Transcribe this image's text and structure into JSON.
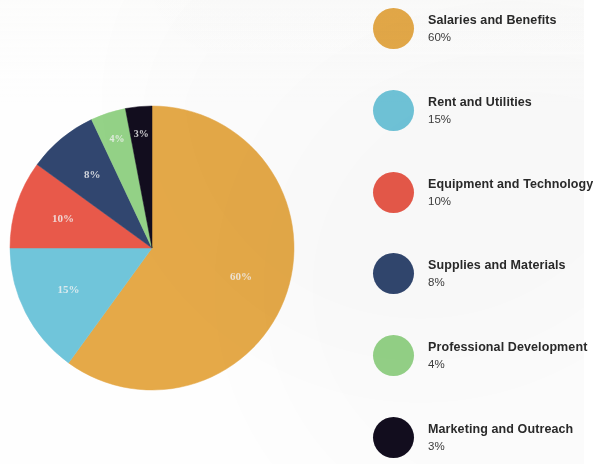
{
  "chart_data": {
    "type": "pie",
    "title": "",
    "subtitle": "",
    "xlabel": "",
    "ylabel": "",
    "legend_position": "right",
    "grid": false,
    "start_angle_deg": 0,
    "direction": "clockwise",
    "total": 100,
    "unit": "%",
    "categories": [
      "Salaries and Benefits",
      "Rent and Utilities",
      "Equipment and Technology",
      "Supplies and Materials",
      "Professional Development",
      "Marketing and Outreach"
    ],
    "values": [
      60,
      15,
      10,
      8,
      4,
      3
    ],
    "slice_labels": [
      "60%",
      "15%",
      "10%",
      "8%",
      "4%",
      "3%"
    ],
    "colors": [
      "#e5a948",
      "#70c5da",
      "#e8594a",
      "#31466f",
      "#94d287",
      "#120d1e"
    ],
    "slices": [
      {
        "label": "Salaries and Benefits",
        "value": 60,
        "display": "60%",
        "color": "#e5a948"
      },
      {
        "label": "Rent and Utilities",
        "value": 15,
        "display": "15%",
        "color": "#70c5da"
      },
      {
        "label": "Equipment and Technology",
        "value": 10,
        "display": "10%",
        "color": "#e8594a"
      },
      {
        "label": "Supplies and Materials",
        "value": 8,
        "display": "8%",
        "color": "#31466f"
      },
      {
        "label": "Professional Development",
        "value": 4,
        "display": "4%",
        "color": "#94d287"
      },
      {
        "label": "Marketing and Outreach",
        "value": 3,
        "display": "3%",
        "color": "#120d1e"
      }
    ]
  },
  "legend": {
    "items": [
      {
        "name": "Salaries and Benefits",
        "percent": "60%",
        "color": "#e5a948"
      },
      {
        "name": "Rent and Utilities",
        "percent": "15%",
        "color": "#70c5da"
      },
      {
        "name": "Equipment and Technology",
        "percent": "10%",
        "color": "#e8594a"
      },
      {
        "name": "Supplies and Materials",
        "percent": "8%",
        "color": "#31466f"
      },
      {
        "name": "Professional Development",
        "percent": "4%",
        "color": "#94d287"
      },
      {
        "name": "Marketing and Outreach",
        "percent": "3%",
        "color": "#120d1e"
      }
    ]
  }
}
